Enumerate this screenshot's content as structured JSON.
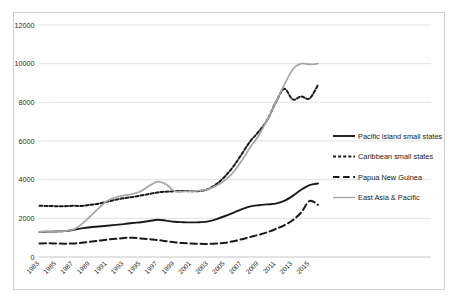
{
  "chart_data": {
    "type": "line",
    "title": "",
    "subtitle": "",
    "xlabel": "",
    "ylabel": "",
    "xlim": [
      1983,
      2016
    ],
    "ylim": [
      0,
      12000
    ],
    "grid": true,
    "legend_position": "right",
    "y_ticks": [
      0,
      2000,
      4000,
      6000,
      8000,
      10000,
      12000
    ],
    "y_tick_labels": [
      "0",
      "2000",
      "4000",
      "6000",
      "8000",
      "10000",
      "12000"
    ],
    "x_tick_labels": [
      "1983",
      "1985",
      "1987",
      "1989",
      "1991",
      "1993",
      "1995",
      "1997",
      "1999",
      "2001",
      "2003",
      "2005",
      "2007",
      "2009",
      "2011",
      "2013",
      "2015"
    ],
    "x": [
      1983,
      1984,
      1985,
      1986,
      1987,
      1988,
      1989,
      1990,
      1991,
      1992,
      1993,
      1994,
      1995,
      1996,
      1997,
      1998,
      1999,
      2000,
      2001,
      2002,
      2003,
      2004,
      2005,
      2006,
      2007,
      2008,
      2009,
      2010,
      2011,
      2012,
      2013,
      2014,
      2015,
      2016
    ],
    "series": [
      {
        "name": "Pacific island small states",
        "color": "#1a1a1a",
        "dash": "solid",
        "width": 1.9,
        "values": [
          1300,
          1310,
          1320,
          1340,
          1400,
          1480,
          1540,
          1580,
          1620,
          1660,
          1700,
          1760,
          1800,
          1860,
          1930,
          1880,
          1820,
          1800,
          1790,
          1800,
          1840,
          1960,
          2120,
          2300,
          2480,
          2620,
          2680,
          2720,
          2760,
          2900,
          3160,
          3480,
          3720,
          3800
        ]
      },
      {
        "name": "Caribbean small states",
        "color": "#1a1a1a",
        "dash": "dotted",
        "width": 2.0,
        "values": [
          2650,
          2640,
          2630,
          2630,
          2650,
          2640,
          2700,
          2760,
          2860,
          2960,
          3040,
          3100,
          3180,
          3260,
          3340,
          3380,
          3400,
          3420,
          3400,
          3420,
          3520,
          3780,
          4180,
          4700,
          5350,
          6000,
          6500,
          7100,
          8000,
          8700,
          8150,
          8300,
          8200,
          8900
        ]
      },
      {
        "name": "Papua New Guinea",
        "color": "#1a1a1a",
        "dash": "dashed",
        "width": 2.0,
        "values": [
          700,
          710,
          700,
          690,
          700,
          740,
          790,
          840,
          900,
          940,
          980,
          1000,
          960,
          920,
          880,
          820,
          760,
          720,
          700,
          680,
          680,
          700,
          740,
          820,
          920,
          1040,
          1150,
          1280,
          1450,
          1640,
          1900,
          2300,
          2900,
          2700
        ]
      },
      {
        "name": "East Asia & Pacific",
        "color": "#a6a6a6",
        "dash": "solid",
        "width": 1.7,
        "values": [
          1300,
          1310,
          1320,
          1340,
          1420,
          1700,
          2100,
          2520,
          2900,
          3080,
          3180,
          3260,
          3400,
          3680,
          3900,
          3760,
          3400,
          3380,
          3400,
          3440,
          3520,
          3700,
          3980,
          4400,
          5000,
          5700,
          6300,
          7100,
          8000,
          8900,
          9700,
          10000,
          9960,
          10000
        ]
      }
    ]
  },
  "legend": {
    "items": [
      {
        "label": "Pacific island small states",
        "style": "solid",
        "color": "#1a1a1a"
      },
      {
        "label": "Caribbean small states",
        "style": "dotted",
        "color": "#1a1a1a"
      },
      {
        "label": "Papua New Guinea",
        "style": "dashed",
        "color": "#1a1a1a"
      },
      {
        "label": "East Asia & Pacific",
        "style": "solid-gray",
        "color": "#a6a6a6"
      }
    ]
  }
}
